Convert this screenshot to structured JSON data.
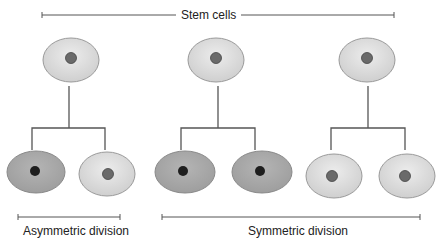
{
  "title_label": "Stem cells",
  "asymmetric_label": "Asymmetric division",
  "symmetric_label": "Symmetric division",
  "colors": {
    "stem_cell_fill": "#dcdcdc",
    "stem_cell_stroke": "#9a9a9a",
    "stem_nucleus": "#6a6a6a",
    "differentiated_fill": "#a8a8a8",
    "differentiated_nucleus": "#1e1e1e",
    "line": "#555555"
  },
  "parents": [
    {
      "id": "parent-1",
      "type": "stem"
    },
    {
      "id": "parent-2",
      "type": "stem"
    },
    {
      "id": "parent-3",
      "type": "stem"
    }
  ],
  "daughters": [
    {
      "parent": "parent-1",
      "type": "differentiated"
    },
    {
      "parent": "parent-1",
      "type": "stem"
    },
    {
      "parent": "parent-2",
      "type": "differentiated"
    },
    {
      "parent": "parent-2",
      "type": "differentiated"
    },
    {
      "parent": "parent-3",
      "type": "stem"
    },
    {
      "parent": "parent-3",
      "type": "stem"
    }
  ]
}
